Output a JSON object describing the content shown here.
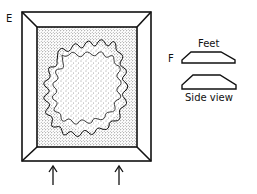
{
  "figure": {
    "label_E": "E",
    "label_F": "F",
    "feet_label": "Feet",
    "side_view_label": "Side view",
    "icons": {
      "arrow_left": "up-arrow",
      "arrow_right": "up-arrow"
    },
    "colors": {
      "line": "#111111",
      "background": "#ffffff",
      "stipple": "#333333"
    }
  }
}
